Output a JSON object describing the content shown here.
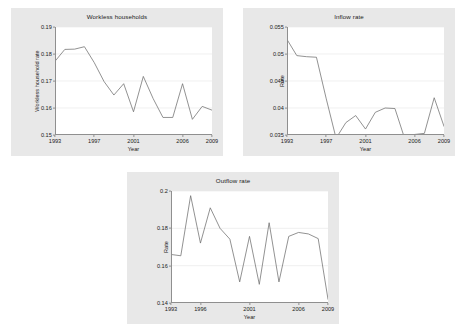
{
  "chart_data": [
    {
      "type": "line",
      "title": "Workless households",
      "xlabel": "Year",
      "ylabel": "Workless household rate",
      "grid": true,
      "legend": null,
      "xlim": [
        1993,
        2009
      ],
      "ylim": [
        0.15,
        0.19
      ],
      "yticks": [
        "0.15",
        "0.16",
        "0.17",
        "0.18",
        "0.19"
      ],
      "ytick_values": [
        0.15,
        0.16,
        0.17,
        0.18,
        0.19
      ],
      "xticks": [
        "1993",
        "1997",
        "2001",
        "2006",
        "2009"
      ],
      "xtick_values": [
        1993,
        1997,
        2001,
        2006,
        2009
      ],
      "x": [
        1993,
        1994,
        1995,
        1996,
        1997,
        1998,
        1999,
        2000,
        2001,
        2002,
        2003,
        2004,
        2005,
        2006,
        2007,
        2008,
        2009
      ],
      "values": [
        0.1773,
        0.1817,
        0.1818,
        0.1827,
        0.1768,
        0.1698,
        0.1648,
        0.169,
        0.1586,
        0.1717,
        0.1635,
        0.1565,
        0.1565,
        0.169,
        0.1558,
        0.1606,
        0.1592
      ],
      "values_note": "final point 0.1679"
    },
    {
      "type": "line",
      "title": "Inflow rate",
      "xlabel": "Year",
      "ylabel": "Rate",
      "grid": true,
      "legend": null,
      "xlim": [
        1993,
        2009
      ],
      "ylim": [
        0.035,
        0.055
      ],
      "yticks": [
        "0.035",
        "0.04",
        "0.045",
        "0.05",
        "0.055"
      ],
      "ytick_values": [
        0.035,
        0.04,
        0.045,
        0.05,
        0.055
      ],
      "xticks": [
        "1993",
        "1997",
        "2001",
        "2006",
        "2009"
      ],
      "xtick_values": [
        1993,
        1997,
        2001,
        2006,
        2009
      ],
      "x": [
        1993,
        1994,
        1995,
        1996,
        1997,
        1998,
        1999,
        2000,
        2001,
        2002,
        2003,
        2004,
        2005,
        2006,
        2007,
        2008,
        2009
      ],
      "values": [
        0.0527,
        0.0497,
        0.0495,
        0.0494,
        0.0417,
        0.0344,
        0.0373,
        0.0386,
        0.0361,
        0.0392,
        0.04,
        0.0399,
        0.0343,
        0.0351,
        0.0353,
        0.0419,
        0.0366
      ],
      "values_note": "final point 0.0450"
    },
    {
      "type": "line",
      "title": "Outflow rate",
      "xlabel": "Year",
      "ylabel": "Rate",
      "grid": true,
      "legend": null,
      "xlim": [
        1993,
        2009
      ],
      "ylim": [
        0.14,
        0.2
      ],
      "yticks": [
        "0.14",
        "0.16",
        "0.18",
        "0.2"
      ],
      "ytick_values": [
        0.14,
        0.16,
        0.18,
        0.2
      ],
      "xticks": [
        "1993",
        "1996",
        "2001",
        "2006",
        "2009"
      ],
      "xtick_values": [
        1993,
        1996,
        2001,
        2006,
        2009
      ],
      "x": [
        1993,
        1994,
        1995,
        1996,
        1997,
        1998,
        1999,
        2000,
        2001,
        2002,
        2003,
        2004,
        2005,
        2006,
        2007,
        2008,
        2009
      ],
      "values": [
        0.166,
        0.1653,
        0.1975,
        0.1721,
        0.191,
        0.18,
        0.1742,
        0.1513,
        0.1757,
        0.15,
        0.183,
        0.1513,
        0.1757,
        0.1778,
        0.177,
        0.1745,
        0.142
      ],
      "values_note": "17 annual observations, 1993-2009"
    }
  ]
}
